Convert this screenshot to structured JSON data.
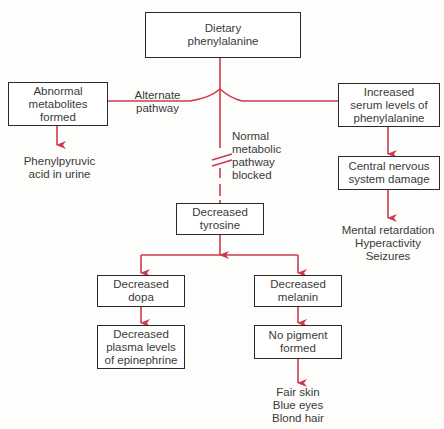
{
  "diagram": {
    "line_color": "#d0384e",
    "nodes": {
      "dietary": "Dietary\nphenylalanine",
      "abnormal": "Abnormal\nmetabolites\nformed",
      "increased_serum": "Increased\nserum levels of\nphenylalanine",
      "cns": "Central nervous\nsystem damage",
      "tyrosine": "Decreased\ntyrosine",
      "dopa": "Decreased\ndopa",
      "melanin": "Decreased\nmelanin",
      "epinephrine": "Decreased\nplasma levels\nof epinephrine",
      "no_pigment": "No pigment\nformed"
    },
    "labels": {
      "alternate": "Alternate\npathway",
      "normal_blocked": "Normal\nmetabolic\npathway\nblocked",
      "urine": "Phenylpyruvic\nacid in urine",
      "cns_effects": "Mental retardation\nHyperactivity\nSeizures",
      "pigment_effects": "Fair skin\nBlue eyes\nBlond hair"
    }
  }
}
